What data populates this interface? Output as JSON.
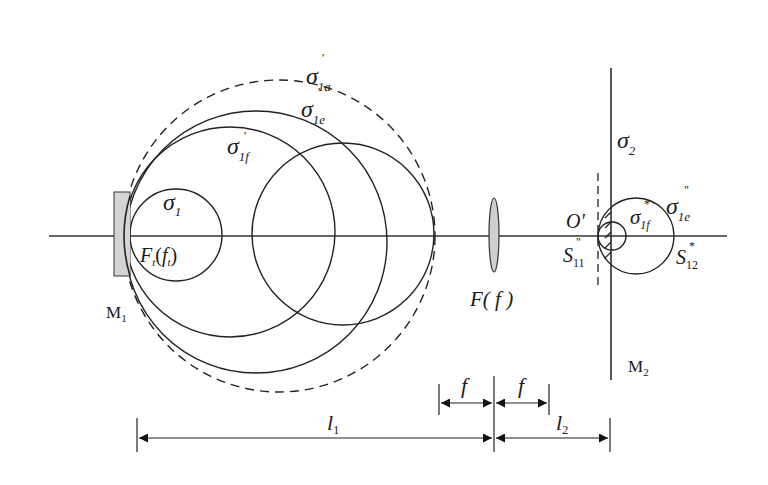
{
  "diagram": {
    "colors": {
      "stroke": "#222222",
      "mirror_fill": "#d4d4d4",
      "lens_fill": "#cfcfcf",
      "background": "#ffffff"
    },
    "labels": {
      "sigma_1a": {
        "base": "σ",
        "sub": "1a",
        "sup": "'"
      },
      "sigma_1e": {
        "base": "σ",
        "sub": "1e",
        "sup": "'"
      },
      "sigma_1f": {
        "base": "σ",
        "sub": "1f",
        "sup": "'"
      },
      "sigma_1": {
        "base": "σ",
        "sub": "1"
      },
      "focal_t": {
        "text_F": "F",
        "sub1": "t",
        "paren_open": "(",
        "text_f": "f",
        "sub2": "t",
        "paren_close": ")"
      },
      "mirror_1": {
        "base": "M",
        "sub": "1"
      },
      "lens": {
        "text": "F( f )"
      },
      "sigma_2": {
        "base": "σ",
        "sub": "2"
      },
      "origin": {
        "text": "O'"
      },
      "s_11": {
        "base": "S",
        "sub": "11",
        "sup": "\""
      },
      "sigma_1f_prime2": {
        "base": "σ",
        "sub": "1f",
        "sup": "*"
      },
      "sigma_1e_dbl": {
        "base": "σ",
        "sub": "1e",
        "sup": "\""
      },
      "s_12": {
        "base": "S",
        "sub": "12",
        "sup": "*"
      },
      "mirror_2": {
        "base": "M",
        "sub": "2"
      }
    },
    "dimensions": {
      "f_left": "f",
      "f_right": "f",
      "l1": {
        "base": "l",
        "sub": "1"
      },
      "l2": {
        "base": "l",
        "sub": "2"
      }
    }
  }
}
